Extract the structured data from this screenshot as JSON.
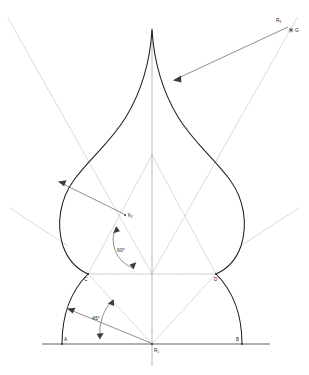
{
  "figure": {
    "type": "geometric-construction-drawing",
    "canvas": {
      "width": 309,
      "height": 375
    },
    "background_color": "#ffffff",
    "line_color": "#1f1f1f",
    "construction_line_color": "#b9a79c",
    "annotation_color": "#4a4a4a"
  },
  "points": [
    {
      "id": "A",
      "label": "A",
      "x": 62,
      "y": 343,
      "label_x": 64,
      "label_y": 341,
      "role": "left-base-point"
    },
    {
      "id": "B",
      "label": "B",
      "x": 242,
      "y": 343,
      "label_x": 238,
      "label_y": 341,
      "role": "right-base-point"
    },
    {
      "id": "C",
      "label": "C",
      "x": 88,
      "y": 274,
      "label_x": 86,
      "label_y": 281,
      "role": "left-waist-point"
    },
    {
      "id": "D",
      "label": "D",
      "x": 216,
      "y": 274,
      "label_x": 215,
      "label_y": 281,
      "role": "right-waist-point"
    },
    {
      "id": "R1",
      "label": "R",
      "sub": "1",
      "x": 152,
      "y": 344,
      "label_x": 154,
      "label_y": 352,
      "role": "base-arc-center"
    },
    {
      "id": "K2",
      "label": "K",
      "sub": "2",
      "x": 125,
      "y": 215,
      "label_x": 128,
      "label_y": 217,
      "role": "bulb-arc-center"
    },
    {
      "id": "R3",
      "label": "R",
      "sub": "3",
      "x": 285,
      "y": 24,
      "label_x": 277,
      "label_y": 22,
      "role": "apex-arc-radius-label"
    },
    {
      "id": "G",
      "label": "G",
      "x": 291,
      "y": 30,
      "label_x": 294,
      "label_y": 32,
      "role": "apex-arc-center"
    }
  ],
  "angles": [
    {
      "id": "angle-45",
      "value": "45°",
      "label_x": 94,
      "label_y": 320,
      "vertex": "R1",
      "description": "45 degree angle at base center R1"
    },
    {
      "id": "angle-60",
      "value": "60°",
      "label_x": 119,
      "label_y": 252,
      "vertex": "K2",
      "description": "60 degree angle at bulb center K2"
    }
  ],
  "elements": {
    "baseline": {
      "name": "ground-baseline",
      "x1": 42,
      "y1": 344,
      "x2": 270,
      "y2": 344
    },
    "axis": {
      "name": "vertical-center-axis",
      "x": 152,
      "y1": 28,
      "y2": 366
    },
    "waist_line": {
      "name": "waist-dotted-line",
      "x1": 88,
      "y1": 274,
      "x2": 216,
      "y2": 274
    },
    "apex": {
      "name": "dome-apex",
      "x": 152,
      "y": 30
    },
    "outline_description": "Onion dome silhouette: bulbous body with cusped apex, symmetric about the vertical axis, resting on two base arcs A-C and D-B.",
    "construction_rays": [
      {
        "name": "ray-upper-left-dotted",
        "x1": 8,
        "y1": 18,
        "x2": 152,
        "y2": 274
      },
      {
        "name": "ray-upper-right-dotted",
        "x1": 296,
        "y1": 18,
        "x2": 152,
        "y2": 274
      },
      {
        "name": "ray-lower-left-dotted",
        "x1": 10,
        "y1": 208,
        "x2": 152,
        "y2": 344
      },
      {
        "name": "ray-lower-right-dotted",
        "x1": 298,
        "y1": 208,
        "x2": 152,
        "y2": 344
      },
      {
        "name": "ray-apex-to-left-waist",
        "x1": 152,
        "y1": 155,
        "x2": 88,
        "y2": 274
      },
      {
        "name": "ray-apex-to-right-waist",
        "x1": 152,
        "y1": 155,
        "x2": 216,
        "y2": 274
      },
      {
        "name": "ray-left-waist-to-base",
        "x1": 88,
        "y1": 274,
        "x2": 152,
        "y2": 344
      },
      {
        "name": "ray-right-waist-to-base",
        "x1": 216,
        "y1": 274,
        "x2": 152,
        "y2": 344
      }
    ],
    "radius_leaders": [
      {
        "name": "radius-leader-R3",
        "from_x": 285,
        "from_y": 26,
        "to_x": 172,
        "to_y": 79,
        "target": "apex curve"
      },
      {
        "name": "radius-leader-K2",
        "from_x": 125,
        "from_y": 215,
        "to_x": 57,
        "to_y": 181,
        "target": "left bulb arc"
      },
      {
        "name": "radius-leader-R1",
        "from_x": 152,
        "from_y": 344,
        "to_x": 67,
        "to_y": 309,
        "target": "left base arc"
      }
    ]
  },
  "legend_notes": {
    "solid_lines": "Dome profile outline and base arcs",
    "dotted_lines": "Construction rays and auxiliary geometry",
    "thin_arrows": "Radius dimension leaders from arc centers"
  }
}
